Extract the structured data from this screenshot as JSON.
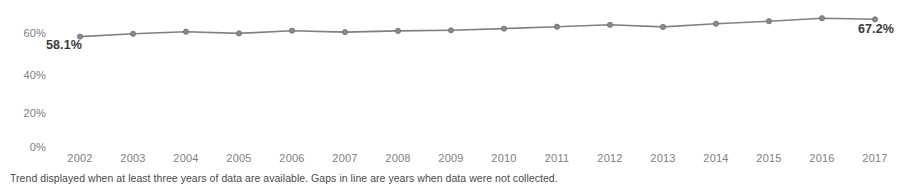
{
  "chart_data": {
    "type": "line",
    "title": "",
    "subtitle": "",
    "xlabel": "",
    "ylabel": "",
    "categories": [
      "2002",
      "2003",
      "2004",
      "2005",
      "2006",
      "2007",
      "2008",
      "2009",
      "2010",
      "2011",
      "2012",
      "2013",
      "2014",
      "2015",
      "2016",
      "2017"
    ],
    "x": [
      2002,
      2003,
      2004,
      2005,
      2006,
      2007,
      2008,
      2009,
      2010,
      2011,
      2012,
      2013,
      2014,
      2015,
      2016,
      2017
    ],
    "values": [
      58.1,
      59.6,
      60.7,
      59.8,
      61.2,
      60.5,
      61.1,
      61.4,
      62.3,
      63.3,
      64.3,
      63.2,
      64.9,
      66.2,
      67.8,
      67.2
    ],
    "series": [
      {
        "name": "Trend",
        "values": [
          58.1,
          59.6,
          60.7,
          59.8,
          61.2,
          60.5,
          61.1,
          61.4,
          62.3,
          63.3,
          64.3,
          63.2,
          64.9,
          66.2,
          67.8,
          67.2
        ]
      }
    ],
    "ylim": [
      0,
      72
    ],
    "yticks": [
      0,
      20,
      40,
      60
    ],
    "ytick_labels": [
      "0%",
      "20%",
      "40%",
      "60%"
    ],
    "xtick_labels": [
      "2002",
      "2003",
      "2004",
      "2005",
      "2006",
      "2007",
      "2008",
      "2009",
      "2010",
      "2011",
      "2012",
      "2013",
      "2014",
      "2015",
      "2016",
      "2017"
    ],
    "grid": false,
    "legend": "none",
    "line_color": "#808080",
    "marker_color": "#8a8a8a",
    "annotations": [
      {
        "label": "58.1%",
        "x": 2002,
        "y": 58.1,
        "position": "below-right"
      },
      {
        "label": "67.2%",
        "x": 2017,
        "y": 67.2,
        "position": "below-left"
      }
    ]
  },
  "axes": {
    "y_ticks": [
      {
        "label": "60%"
      },
      {
        "label": "40%"
      },
      {
        "label": "20%"
      },
      {
        "label": "0%"
      }
    ],
    "x_ticks": [
      {
        "label": "2002"
      },
      {
        "label": "2003"
      },
      {
        "label": "2004"
      },
      {
        "label": "2005"
      },
      {
        "label": "2006"
      },
      {
        "label": "2007"
      },
      {
        "label": "2008"
      },
      {
        "label": "2009"
      },
      {
        "label": "2010"
      },
      {
        "label": "2011"
      },
      {
        "label": "2012"
      },
      {
        "label": "2013"
      },
      {
        "label": "2014"
      },
      {
        "label": "2015"
      },
      {
        "label": "2016"
      },
      {
        "label": "2017"
      }
    ]
  },
  "annotations": {
    "start_value": "58.1%",
    "end_value": "67.2%"
  },
  "footnote": {
    "text": "Trend displayed when at least three years of data are available. Gaps in line are years when data were not collected."
  },
  "colors": {
    "line": "#808080",
    "marker": "#8a8a8a",
    "axis_text": "#808080",
    "annotation_text": "#3a3a3a",
    "footnote_text": "#4a4a4a",
    "background": "#ffffff"
  }
}
